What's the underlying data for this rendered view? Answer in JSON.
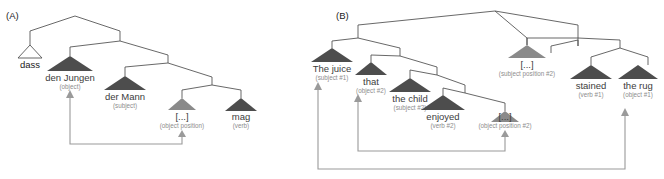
{
  "figure": {
    "width": 664,
    "height": 179,
    "background": "#ffffff",
    "colors": {
      "edge": "#4d4d4d",
      "triangle_filled": "#4d4d4d",
      "triangle_light": "#8a8a8a",
      "triangle_open_fill": "#ffffff",
      "word_text": "#3c3c3c",
      "word_text_dark": "#1a1a1a",
      "role_text": "#8d8d8d",
      "arrow": "#9a9a9a"
    }
  },
  "panels": [
    {
      "id": "panel-a",
      "tag": "(A)",
      "language": "German",
      "sentence": "dass den Jungen der Mann mag",
      "nodes": [
        {
          "id": "a-dass",
          "word": "dass",
          "role": "",
          "triangle": "open"
        },
        {
          "id": "a-jungen",
          "word": "den Jungen",
          "role": "(object)",
          "triangle": "filled"
        },
        {
          "id": "a-mann",
          "word": "der Mann",
          "role": "(subject)",
          "triangle": "filled"
        },
        {
          "id": "a-gap-obj",
          "word": "[...]",
          "role": "(object position)",
          "triangle": "light"
        },
        {
          "id": "a-mag",
          "word": "mag",
          "role": "(verb)",
          "triangle": "filled"
        }
      ],
      "movements": [
        {
          "id": "a-move-object",
          "from": "a-gap-obj",
          "to": "a-jungen"
        }
      ]
    },
    {
      "id": "panel-b",
      "tag": "(B)",
      "language": "English",
      "sentence": "The juice that the child enjoyed stained the rug",
      "nodes": [
        {
          "id": "b-juice",
          "word": "The juice",
          "role": "(subject #1)",
          "triangle": "filled"
        },
        {
          "id": "b-that",
          "word": "that",
          "role": "(object #2)",
          "triangle": "filled"
        },
        {
          "id": "b-child",
          "word": "the child",
          "role": "(subject #2)",
          "triangle": "filled"
        },
        {
          "id": "b-enjoyed",
          "word": "enjoyed",
          "role": "(verb #2)",
          "triangle": "filled"
        },
        {
          "id": "b-gap-obj2",
          "word": "[...]",
          "role": "(object position #2)",
          "triangle": "light"
        },
        {
          "id": "b-gap-subj2",
          "word": "[...]",
          "role": "(subject position #2)",
          "triangle": "light"
        },
        {
          "id": "b-stained",
          "word": "stained",
          "role": "(verb #1)",
          "triangle": "filled"
        },
        {
          "id": "b-rug",
          "word": "the rug",
          "role": "(object #1)",
          "triangle": "filled"
        }
      ],
      "movements": [
        {
          "id": "b-move-object",
          "from": "b-gap-obj2",
          "to": "b-that"
        },
        {
          "id": "b-move-subject",
          "from": "b-gap-subj2",
          "to": "b-juice"
        }
      ]
    }
  ]
}
